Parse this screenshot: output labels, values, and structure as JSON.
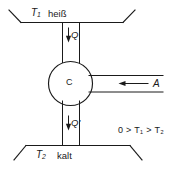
{
  "diagram": {
    "type": "thermodynamic-heat-engine-schematic",
    "hot_reservoir": {
      "temperature_label": "T",
      "temperature_subscript": "1",
      "state_label": "heiß"
    },
    "cold_reservoir": {
      "temperature_label": "T",
      "temperature_subscript": "2",
      "state_label": "kalt"
    },
    "engine": {
      "label": "C"
    },
    "flows": {
      "heat_in": {
        "label": "Q",
        "direction": "down"
      },
      "heat_out": {
        "label": "Q'",
        "direction": "down"
      },
      "work": {
        "label": "A",
        "direction": "left"
      }
    },
    "relation": {
      "text": "0 > T₁ > T₂"
    },
    "colors": {
      "ink": "#1a1a1a",
      "background": "#ffffff"
    }
  }
}
